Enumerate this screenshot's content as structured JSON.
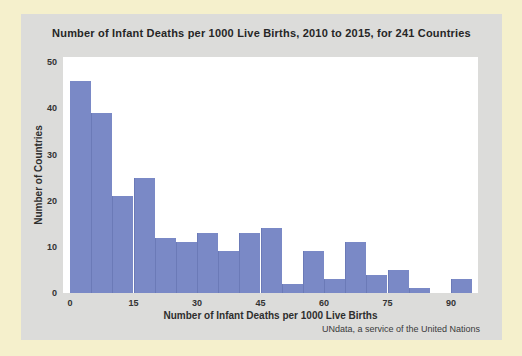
{
  "page": {
    "background_color": "#f5f0cc",
    "card_color": "#dcdcda",
    "plot_color": "#ffffff"
  },
  "chart": {
    "title": "Number of Infant Deaths per 1000 Live Births, 2010 to 2015, for 241 Countries",
    "xlabel": "Number of Infant Deaths per 1000 Live Births",
    "ylabel": "Number of Countries",
    "footer": "UNdata, a service of the United Nations",
    "bar_color": "#7a89c6",
    "bar_seam_color": "#5f6eac",
    "text_color": "#2e2e2e"
  },
  "chart_data": {
    "type": "bar",
    "subtype": "histogram",
    "title": "Number of Infant Deaths per 1000 Live Births, 2010 to 2015, for 241 Countries",
    "xlabel": "Number of Infant Deaths per 1000 Live Births",
    "ylabel": "Number of Countries",
    "annotation": "UNdata, a service of the United Nations",
    "bin_width": 5,
    "categories": [
      "0-5",
      "5-10",
      "10-15",
      "15-20",
      "20-25",
      "25-30",
      "30-35",
      "35-40",
      "40-45",
      "45-50",
      "50-55",
      "55-60",
      "60-65",
      "65-70",
      "70-75",
      "75-80",
      "80-85",
      "85-90",
      "90-95"
    ],
    "values": [
      46,
      39,
      21,
      25,
      12,
      11,
      13,
      9,
      13,
      14,
      2,
      9,
      3,
      11,
      4,
      5,
      1,
      0,
      3
    ],
    "total_count": 241,
    "x_ticks": [
      0,
      15,
      30,
      45,
      60,
      75,
      90
    ],
    "y_ticks": [
      0,
      10,
      20,
      30,
      40,
      50
    ],
    "xlim": [
      0,
      98
    ],
    "ylim": [
      0,
      51
    ],
    "grid": false,
    "legend": false
  }
}
